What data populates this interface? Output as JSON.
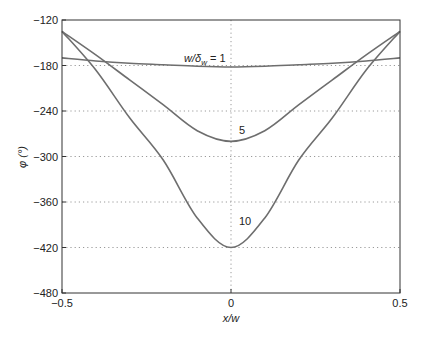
{
  "chart_data": {
    "type": "line",
    "title": "",
    "xlabel": "x/w",
    "ylabel": "φ (°)",
    "xlim": [
      -0.5,
      0.5
    ],
    "ylim": [
      -480,
      -120
    ],
    "xticks": [
      -0.5,
      0,
      0.5
    ],
    "xtick_labels": [
      "−0.5",
      "0",
      "0.5"
    ],
    "yticks": [
      -120,
      -180,
      -240,
      -300,
      -360,
      -420,
      -480
    ],
    "ytick_labels": [
      "−120",
      "−180",
      "−240",
      "−300",
      "−360",
      "−420",
      "−480"
    ],
    "grid": true,
    "legend": "none (inline curve labels)",
    "x": [
      -0.5,
      -0.4,
      -0.3,
      -0.2,
      -0.1,
      0,
      0.1,
      0.2,
      0.3,
      0.4,
      0.5
    ],
    "series": [
      {
        "name": "w/δw = 1",
        "label": "w/δ",
        "label_sub": "w",
        "label_tail": " = 1",
        "values": [
          -170,
          -174,
          -177,
          -179,
          -181,
          -182,
          -181,
          -179,
          -177,
          -174,
          -170
        ]
      },
      {
        "name": "5",
        "label": "5",
        "values": [
          -135,
          -166,
          -199,
          -232,
          -266,
          -280,
          -266,
          -232,
          -199,
          -166,
          -135
        ]
      },
      {
        "name": "10",
        "label": "10",
        "values": [
          -135,
          -186,
          -249,
          -305,
          -381,
          -420,
          -381,
          -305,
          -249,
          -186,
          -135
        ]
      }
    ],
    "line_color": "#6e6e6e",
    "grid_color": "#9a9a9a",
    "axis_color": "#333333"
  }
}
